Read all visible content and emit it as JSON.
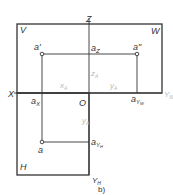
{
  "diagram": {
    "caption": "b)",
    "planes": {
      "V": "V",
      "W": "W",
      "H": "H"
    },
    "axes": {
      "Z": "Z",
      "X": "X",
      "YW": "Y",
      "YW_sub": "W",
      "YH": "Y",
      "YH_sub": "H",
      "origin": "O"
    },
    "points": {
      "a_front": "a'",
      "a_side": "a\"",
      "a_top": "a",
      "aZ": "a",
      "aZ_sub": "Z",
      "aX": "a",
      "aX_sub": "X",
      "aYW": "a",
      "aYW_sub": "Y",
      "aYW_subsub": "W",
      "aYH": "a",
      "aYH_sub": "Y",
      "aYH_subsub": "H"
    },
    "dimensions": {
      "xA": "x",
      "xA_sub": "A",
      "yA_right": "y",
      "yA_right_sub": "A",
      "zA": "z",
      "zA_sub": "A",
      "yA_down": "y",
      "yA_down_sub": "A"
    },
    "colors": {
      "line": "#333333",
      "dim_text": "#b8b8b8"
    }
  }
}
